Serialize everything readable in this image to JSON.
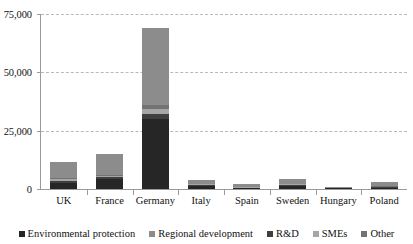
{
  "chart_data": {
    "type": "bar",
    "subtype": "stacked-vertical-bar",
    "title": "",
    "subtitle": "",
    "xlabel": "",
    "ylabel": "",
    "ylim": [
      0,
      75000
    ],
    "yticks": [
      0,
      25000,
      50000,
      75000
    ],
    "ytick_labels": [
      "0",
      "25,000",
      "50,000",
      "75,000"
    ],
    "grid": true,
    "grid_axis": "y",
    "grid_style": "dashed",
    "legend_position": "bottom",
    "categories": [
      "UK",
      "France",
      "Germany",
      "Italy",
      "Spain",
      "Sweden",
      "Hungary",
      "Poland"
    ],
    "series": [
      {
        "name": "Environmental protection",
        "color": "#262626",
        "values": [
          2700,
          4100,
          30000,
          1100,
          300,
          1100,
          250,
          500
        ]
      },
      {
        "name": "Regional development",
        "color": "#8c8c8c",
        "values": [
          6900,
          9100,
          33000,
          1700,
          1400,
          2100,
          400,
          2100
        ]
      },
      {
        "name": "R&D",
        "color": "#3f3f3f",
        "values": [
          800,
          900,
          2200,
          450,
          200,
          500,
          100,
          250
        ]
      },
      {
        "name": "SMEs",
        "color": "#a6a6a6",
        "values": [
          700,
          600,
          2100,
          450,
          200,
          400,
          100,
          200
        ]
      },
      {
        "name": "Other",
        "color": "#737373",
        "values": [
          400,
          300,
          1700,
          300,
          100,
          200,
          50,
          150
        ]
      }
    ],
    "totals": [
      11500,
      15000,
      69000,
      4000,
      2200,
      4300,
      900,
      3200
    ]
  },
  "legend": {
    "items": [
      {
        "label": "Environmental protection",
        "color": "#262626"
      },
      {
        "label": "Regional development",
        "color": "#8c8c8c"
      },
      {
        "label": "R&D",
        "color": "#3f3f3f"
      },
      {
        "label": "SMEs",
        "color": "#a6a6a6"
      },
      {
        "label": "Other",
        "color": "#737373"
      }
    ]
  },
  "axis": {
    "y_tick_labels": [
      "75,000",
      "50,000",
      "25,000",
      "0"
    ]
  }
}
